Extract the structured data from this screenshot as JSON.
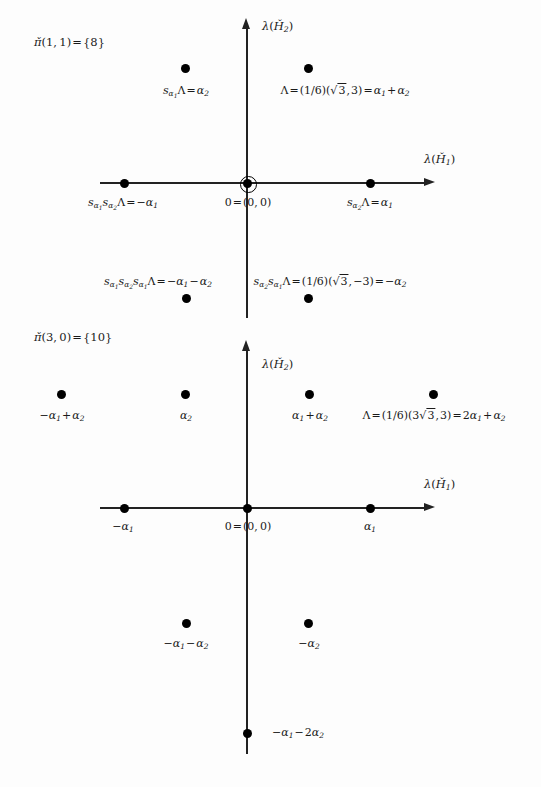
{
  "figure": {
    "type": "weight-diagram",
    "background_color": "#fdfdfd",
    "ink_color": "#1a1a1a"
  },
  "diagram1": {
    "title": "π̌(1, 1) = {8}",
    "title_parts": {
      "pi": "π̌",
      "args": "(1, 1)",
      "equals": "=",
      "set": "{8}"
    },
    "axis_x_label": "λ(Ȟ₁)",
    "axis_y_label": "λ(Ȟ₂)",
    "origin_label": "0 = (0, 0)",
    "origin_multiplicity": 2,
    "weights": [
      {
        "name": "s_alpha1-Lambda",
        "label": "sα₁Λ = α₂",
        "x": -1,
        "y": 1
      },
      {
        "name": "Lambda",
        "label": "Λ = (1/6)(√3, 3) = α₁ + α₂",
        "x": 1,
        "y": 1
      },
      {
        "name": "s_alpha1-s_alpha2-Lambda",
        "label": "sα₁sα₂Λ = −α₁",
        "x": -2,
        "y": 0
      },
      {
        "name": "origin",
        "label": "0 = (0, 0)",
        "x": 0,
        "y": 0
      },
      {
        "name": "s_alpha2-Lambda",
        "label": "sα₂Λ = α₁",
        "x": 2,
        "y": 0
      },
      {
        "name": "s_alpha1-s_alpha2-s_alpha1-Lambda",
        "label": "sα₁sα₂sα₁Λ = −α₁ − α₂",
        "x": -1,
        "y": -1
      },
      {
        "name": "s_alpha2-s_alpha1-Lambda",
        "label": "sα₂sα₁Λ = (1/6)(√3, −3) = −α₂",
        "x": 1,
        "y": -1
      }
    ],
    "labels": {
      "s_a1_Lambda": {
        "pre": "s",
        "sub1": "α",
        "sub1sub": "1",
        "mid": "Λ = ",
        "post": "α",
        "postsub": "2"
      },
      "Lambda_top": {
        "text": "Λ = (1/6)(√3, 3) = α₁ + α₂"
      },
      "neg_alpha1": {
        "text": "sα₁sα₂Λ = −α₁"
      },
      "pos_alpha1": {
        "text": "sα₂Λ = α₁"
      },
      "neg_a1_a2": {
        "text": "sα₁sα₂sα₁Λ = −α₁ − α₂"
      },
      "neg_alpha2": {
        "text": "sα₂sα₁Λ = (1/6)(√3, −3) = −α₂"
      }
    }
  },
  "diagram2": {
    "title": "π̌(3, 0) = {10}",
    "title_parts": {
      "pi": "π̌",
      "args": "(3, 0)",
      "equals": "=",
      "set": "{10}"
    },
    "axis_x_label": "λ(Ȟ₁)",
    "axis_y_label": "λ(Ȟ₂)",
    "origin_label": "0 = (0, 0)",
    "weights": [
      {
        "name": "neg-alpha1-plus-alpha2",
        "label": "−α₁ + α₂",
        "x": -3,
        "y": 1
      },
      {
        "name": "alpha2",
        "label": "α₂",
        "x": -1,
        "y": 1
      },
      {
        "name": "alpha1-plus-alpha2",
        "label": "α₁ + α₂",
        "x": 1,
        "y": 1
      },
      {
        "name": "Lambda",
        "label": "Λ = (1/6)(3√3, 3) = 2α₁ + α₂",
        "x": 3,
        "y": 1
      },
      {
        "name": "neg-alpha1",
        "label": "−α₁",
        "x": -2,
        "y": 0
      },
      {
        "name": "origin",
        "label": "0 = (0, 0)",
        "x": 0,
        "y": 0
      },
      {
        "name": "alpha1",
        "label": "α₁",
        "x": 2,
        "y": 0
      },
      {
        "name": "neg-alpha1-minus-alpha2",
        "label": "−α₁ − α₂",
        "x": -1,
        "y": -1
      },
      {
        "name": "neg-alpha2",
        "label": "−α₂",
        "x": 1,
        "y": -1
      },
      {
        "name": "neg-alpha1-minus-2alpha2",
        "label": "−α₁ − 2α₂",
        "x": 0,
        "y": -2
      }
    ]
  }
}
